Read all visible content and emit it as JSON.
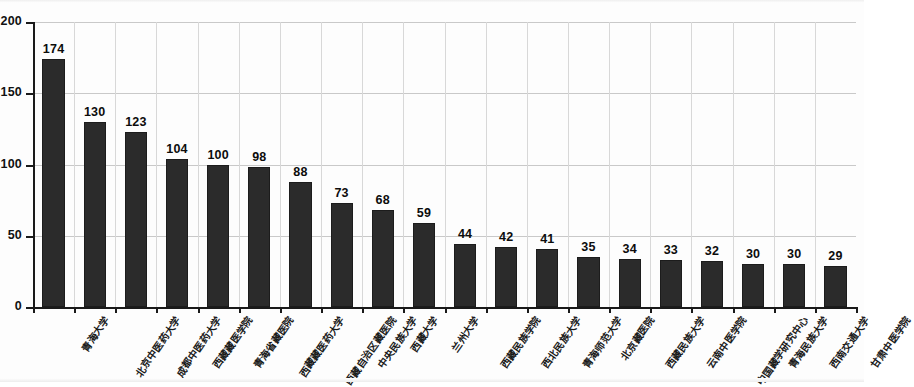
{
  "chart_data": {
    "type": "bar",
    "title": "",
    "subtitle": "",
    "xlabel": "",
    "ylabel": "",
    "ylim": [
      0,
      200
    ],
    "yticks": [
      "0",
      "50",
      "100",
      "150",
      "200"
    ],
    "grid": "horizontal-and-vertical",
    "legend": "none",
    "orientation": "vertical",
    "bar_color": "#2b2b2b",
    "axis_color": "#1a1a1a",
    "gridline_color": "#c9c9c9",
    "label_rotation_deg": -55,
    "categories": [
      "青海大学",
      "北京中医药大学",
      "成都中医药大学",
      "西藏藏医学院",
      "青海省藏医院",
      "西藏藏医药大学",
      "西藏自治区藏医院",
      "中央民族大学",
      "西藏大学",
      "兰州大学",
      "西藏民族学院",
      "西北民族大学",
      "青海师范大学",
      "北京藏医院",
      "西藏民族大学",
      "云南中医学院",
      "中国藏学研究中心",
      "青海民族大学",
      "西南交通大学",
      "甘肃中医学院"
    ],
    "values": [
      174,
      130,
      123,
      104,
      100,
      98,
      88,
      73,
      68,
      59,
      44,
      42,
      41,
      35,
      34,
      33,
      32,
      30,
      30,
      29
    ]
  }
}
